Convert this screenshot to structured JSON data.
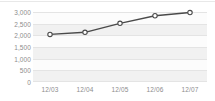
{
  "chart_data": {
    "type": "line",
    "title": "",
    "xlabel": "",
    "ylabel": "",
    "categories": [
      "12/03",
      "12/04",
      "12/05",
      "12/06",
      "12/07"
    ],
    "values": [
      2070,
      2160,
      2550,
      2880,
      3020
    ],
    "series": [
      {
        "name": "",
        "values": [
          2070,
          2160,
          2550,
          2880,
          3020
        ]
      }
    ],
    "ylim": [
      0,
      3000
    ],
    "ytick_labels": [
      "3,000",
      "2,500",
      "2,000",
      "1,500",
      "1,000",
      "500",
      "0"
    ],
    "ytick_values": [
      3000,
      2500,
      2000,
      1500,
      1000,
      500,
      0
    ],
    "ystep": 500,
    "grid": true,
    "legend": "none",
    "marker": "open-circle",
    "line_color": "#4a4a4a",
    "marker_fill": "#ffffff",
    "marker_stroke": "#4a4a4a",
    "grid_color": "#e4e4e4",
    "band_color": "#f1f1f1",
    "plot_background": "#fbfbfb",
    "label_color": "#8d8d8d"
  }
}
